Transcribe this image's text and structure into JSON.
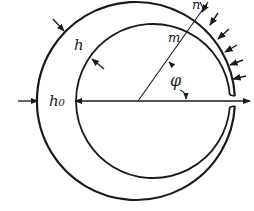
{
  "diagram": {
    "type": "eccentric thick ring (crescent) under external pressure",
    "labels": {
      "h": "h",
      "h0": "h₀",
      "m": "m",
      "n": "n",
      "phi": "φ"
    },
    "colors": {
      "stroke": "#1a1a1a",
      "background": "#ffffff"
    },
    "pressure_arrow_count": 6
  }
}
